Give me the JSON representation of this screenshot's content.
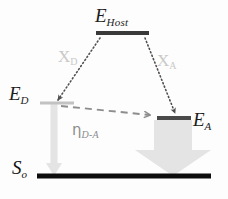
{
  "figure": {
    "type": "energy-level-diagram",
    "background_color": "#fdfdfd",
    "width": 228,
    "height": 199
  },
  "levels": {
    "host": {
      "label_base": "E",
      "label_sub": "Host",
      "name": "E_Host",
      "color": "#3a3a3a",
      "x1": 96,
      "x2": 149,
      "y": 33,
      "thickness": 4
    },
    "donor": {
      "label_base": "E",
      "label_sub": "D",
      "name": "E_D",
      "color": "#c2c2c2",
      "x1": 40,
      "x2": 74,
      "y": 103,
      "thickness": 3
    },
    "acceptor": {
      "label_base": "E",
      "label_sub": "A",
      "name": "E_A",
      "color": "#4a4a4a",
      "x1": 157,
      "x2": 191,
      "y": 118,
      "thickness": 4
    },
    "ground": {
      "label_base": "S",
      "label_sub": "o",
      "name": "S_o",
      "color": "#0d0d0d",
      "x1": 37,
      "x2": 211,
      "y": 176,
      "thickness": 5
    }
  },
  "transfers": {
    "x_donor": {
      "label_base": "X",
      "label_sub": "D",
      "name": "X_D",
      "style": "dotted",
      "color": "#4f4f4f",
      "label_color": "#c9c9c9",
      "from_x": 100,
      "from_y": 38,
      "to_x": 57,
      "to_y": 101
    },
    "x_acceptor": {
      "label_base": "X",
      "label_sub": "A",
      "name": "X_A",
      "style": "dotted",
      "color": "#4f4f4f",
      "label_color": "#c9c9c9",
      "from_x": 145,
      "from_y": 38,
      "to_x": 176,
      "to_y": 114
    },
    "eta_d_a": {
      "label_base": "η",
      "label_sub": "D-A",
      "name": "eta_D-A",
      "style": "dashed",
      "color": "#8d8d8d",
      "from_x": 60,
      "from_y": 106,
      "to_x": 156,
      "to_y": 116
    }
  },
  "emissions": {
    "donor_emission": {
      "name": "donor-emission-arrow",
      "color": "#e2e2e2",
      "shaft_x": 54,
      "shaft_width": 7,
      "top_y": 104,
      "bottom_y": 176,
      "head_width": 15,
      "head_height": 14,
      "strength": "weak"
    },
    "acceptor_emission": {
      "name": "acceptor-emission-arrow",
      "color": "#e2e2e2",
      "shaft_x": 173,
      "shaft_width": 38,
      "top_y": 120,
      "bottom_y": 176,
      "head_width": 74,
      "head_height": 26,
      "strength": "strong"
    }
  }
}
